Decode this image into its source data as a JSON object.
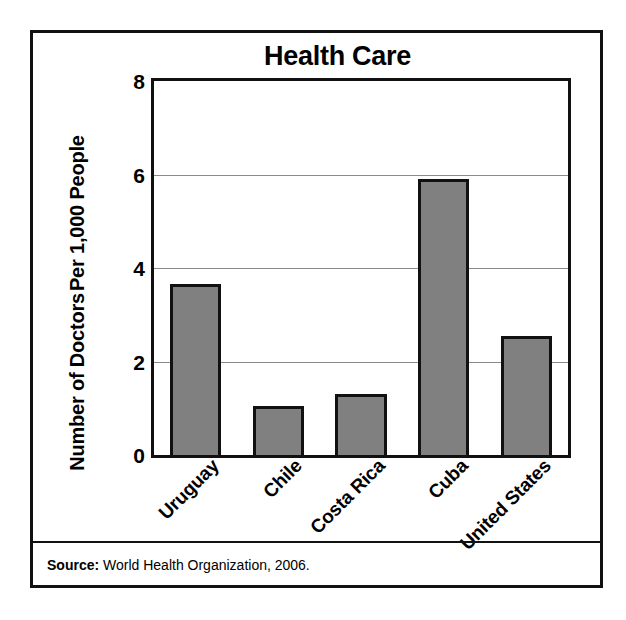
{
  "chart_data": {
    "type": "bar",
    "title": "Health Care",
    "xlabel": "",
    "ylabel": "Number of Doctors Per 1,000 People",
    "ylabel_line1": "Number of Doctors",
    "ylabel_line2": "Per 1,000 People",
    "categories": [
      "Uruguay",
      "Chile",
      "Costa Rica",
      "Cuba",
      "United States"
    ],
    "values": [
      3.65,
      1.05,
      1.3,
      5.9,
      2.55
    ],
    "ylim": [
      0,
      8
    ],
    "yticks": [
      0,
      2,
      4,
      6,
      8
    ],
    "ytick_labels": [
      "0",
      "2",
      "4",
      "6",
      "8"
    ],
    "grid": true,
    "grid_axis": "y",
    "legend": "none",
    "bar_color": "#808080",
    "bar_edge_color": "#111111",
    "gridline_color": "#8a8a8a",
    "axis_color": "#111111"
  },
  "source": {
    "label": "Source:",
    "text": " World Health Organization, 2006."
  }
}
